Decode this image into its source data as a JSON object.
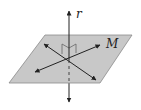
{
  "diagram": {
    "labels": {
      "line": "r",
      "plane": "M"
    },
    "colors": {
      "plane_fill": "#c8c8c8",
      "plane_stroke": "#8a8a8a",
      "line": "#222222"
    },
    "elements": [
      {
        "type": "plane",
        "name": "M"
      },
      {
        "type": "line",
        "name": "r",
        "relation": "perpendicular to M"
      },
      {
        "type": "line-in-plane",
        "count": 2
      },
      {
        "type": "right-angle-marker",
        "count": 2
      }
    ]
  }
}
